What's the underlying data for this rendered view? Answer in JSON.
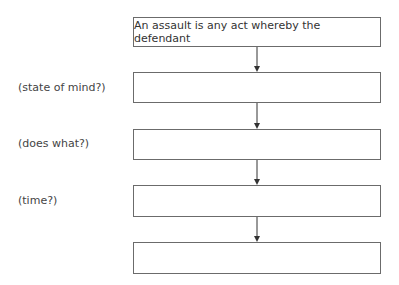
{
  "diagram": {
    "type": "flowchart",
    "boxes": [
      {
        "id": "b1",
        "text": "An assault is any act whereby the defendant"
      },
      {
        "id": "b2",
        "text": ""
      },
      {
        "id": "b3",
        "text": ""
      },
      {
        "id": "b4",
        "text": ""
      },
      {
        "id": "b5",
        "text": ""
      }
    ],
    "labels": [
      {
        "for": "b2",
        "text": "(state of mind?)"
      },
      {
        "for": "b3",
        "text": "(does what?)"
      },
      {
        "for": "b4",
        "text": "(time?)"
      }
    ],
    "edges": [
      [
        "b1",
        "b2"
      ],
      [
        "b2",
        "b3"
      ],
      [
        "b3",
        "b4"
      ],
      [
        "b4",
        "b5"
      ]
    ],
    "colors": {
      "border": "#6b6b6b",
      "arrow": "#333333",
      "text": "#333333"
    }
  }
}
